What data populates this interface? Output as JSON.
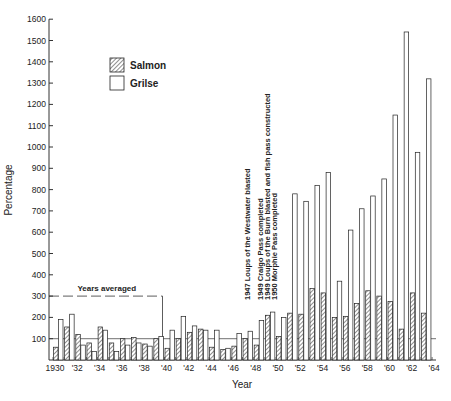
{
  "chart_data": {
    "type": "bar",
    "title": "",
    "xlabel": "Year",
    "ylabel": "Percentage",
    "ylim": [
      0,
      1600
    ],
    "yticks": [
      100,
      200,
      300,
      400,
      500,
      600,
      700,
      800,
      900,
      1000,
      1100,
      1200,
      1300,
      1400,
      1500,
      1600
    ],
    "xtick_labels": [
      "1930",
      "'32",
      "'34",
      "'36",
      "'38",
      "'40",
      "'42",
      "'44",
      "'46",
      "'48",
      "'50",
      "'52",
      "'54",
      "'56",
      "'58",
      "'60",
      "'62",
      "'64"
    ],
    "legend": [
      {
        "name": "Salmon",
        "style": "hatched"
      },
      {
        "name": "Grilse",
        "style": "open"
      }
    ],
    "categories": [
      1930,
      1931,
      1932,
      1933,
      1934,
      1935,
      1936,
      1937,
      1938,
      1939,
      1940,
      1941,
      1942,
      1943,
      1944,
      1945,
      1946,
      1947,
      1948,
      1949,
      1950,
      1951,
      1952,
      1953,
      1954,
      1955,
      1956,
      1957,
      1958,
      1959,
      1960,
      1961,
      1962,
      1963,
      1964
    ],
    "series": [
      {
        "name": "Salmon",
        "values": [
          60,
          155,
          120,
          80,
          155,
          80,
          100,
          105,
          75,
          100,
          55,
          100,
          130,
          145,
          60,
          50,
          65,
          100,
          70,
          210,
          110,
          220,
          215,
          335,
          315,
          200,
          205,
          265,
          325,
          300,
          275,
          145,
          315,
          220,
          0
        ]
      },
      {
        "name": "Grilse",
        "values": [
          190,
          215,
          70,
          40,
          140,
          40,
          70,
          80,
          65,
          110,
          140,
          205,
          160,
          140,
          140,
          55,
          125,
          135,
          185,
          225,
          200,
          780,
          745,
          820,
          880,
          370,
          610,
          710,
          770,
          850,
          1150,
          1540,
          975,
          1320,
          0
        ]
      }
    ],
    "reference_line": 100,
    "averaged_line": {
      "value": 300,
      "label": "Years averaged",
      "from": 1930,
      "to": 1939
    },
    "annotations": [
      "1947 Loups of the Westwater blasted",
      "1949 Craigo Pass completed",
      "1949 Loups of the Burn blasted and fish pass constructed",
      "1950 Morphie Pass completed"
    ]
  }
}
